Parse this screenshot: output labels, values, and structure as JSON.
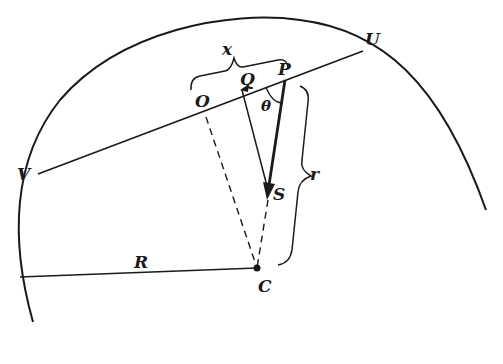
{
  "diagram": {
    "type": "geometry",
    "labels": {
      "x": "x",
      "O": "O",
      "Q": "Q",
      "P": "P",
      "theta": "θ",
      "U": "U",
      "V": "V",
      "S": "S",
      "r": "r",
      "R": "R",
      "C": "C"
    },
    "colors": {
      "ink": "#1a1a1a",
      "background": "#ffffff"
    }
  }
}
